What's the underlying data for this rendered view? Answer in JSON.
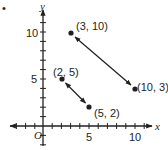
{
  "figure": {
    "bullet": "•",
    "axes": {
      "x_label": "x",
      "y_label": "y",
      "origin_label": "O",
      "x_ticks": [
        "5",
        "10"
      ],
      "y_ticks": [
        "5",
        "10"
      ]
    },
    "points": [
      {
        "label": "(3, 10)",
        "x": 3,
        "y": 10
      },
      {
        "label": "(10, 3)",
        "x": 10,
        "y": 3
      },
      {
        "label": "(2, 5)",
        "x": 2,
        "y": 5
      },
      {
        "label": "(5, 2)",
        "x": 5,
        "y": 2
      }
    ],
    "segments": [
      {
        "from": "(3, 10)",
        "to": "(10, 3)",
        "style": "double-arrow"
      },
      {
        "from": "(2, 5)",
        "to": "(5, 2)",
        "style": "double-arrow"
      }
    ],
    "colors": {
      "ink": "#231f20"
    }
  }
}
